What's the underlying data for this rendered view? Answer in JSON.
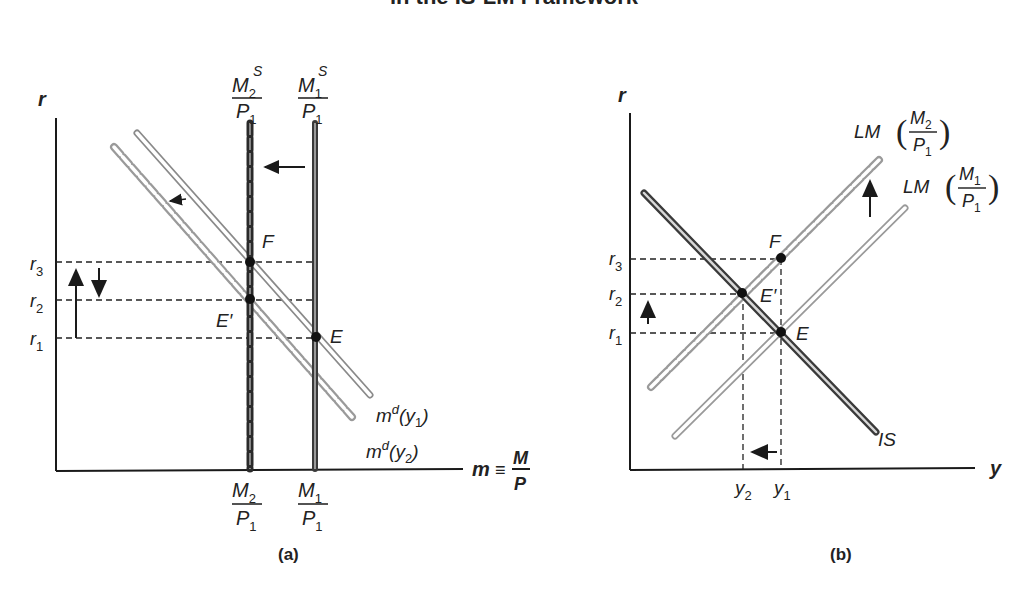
{
  "title": "in the IS-LM Framework",
  "panel_a": {
    "caption": "(a)",
    "y_axis": "r",
    "x_axis": "m ≡ M/P",
    "x_axis_m": "m",
    "x_axis_eq": "≡",
    "x_axis_num": "M",
    "x_axis_den": "P",
    "supply_labels": [
      {
        "num": "M",
        "num_sub": "2",
        "num_sup": "S",
        "den": "P",
        "den_sub": "1"
      },
      {
        "num": "M",
        "num_sub": "1",
        "num_sup": "S",
        "den": "P",
        "den_sub": "1"
      }
    ],
    "tick_labels": [
      {
        "num": "M",
        "num_sub": "2",
        "den": "P",
        "den_sub": "1"
      },
      {
        "num": "M",
        "num_sub": "1",
        "den": "P",
        "den_sub": "1"
      }
    ],
    "r_labels": [
      {
        "base": "r",
        "sub": "3"
      },
      {
        "base": "r",
        "sub": "2"
      },
      {
        "base": "r",
        "sub": "1"
      }
    ],
    "points": [
      "F",
      "E′",
      "E"
    ],
    "demand_labels": [
      {
        "base": "m",
        "sup": "d",
        "arg": "(y",
        "sub": "1",
        "close": ")"
      },
      {
        "base": "m",
        "sup": "d",
        "arg": "(y",
        "sub": "2",
        "close": ")"
      }
    ]
  },
  "panel_b": {
    "caption": "(b)",
    "y_axis": "r",
    "x_axis": "y",
    "r_labels": [
      {
        "base": "r",
        "sub": "3"
      },
      {
        "base": "r",
        "sub": "2"
      },
      {
        "base": "r",
        "sub": "1"
      }
    ],
    "y_labels": [
      {
        "base": "y",
        "sub": "2"
      },
      {
        "base": "y",
        "sub": "1"
      }
    ],
    "points": [
      "F",
      "E′",
      "E"
    ],
    "curve_labels": {
      "is": "IS",
      "lm2": {
        "prefix": "LM",
        "num": "M",
        "num_sub": "2",
        "den": "P",
        "den_sub": "1"
      },
      "lm1": {
        "prefix": "LM",
        "num": "M",
        "num_sub": "1",
        "den": "P",
        "den_sub": "1"
      }
    }
  },
  "colors": {
    "ink": "#1a1a1a",
    "dark_curve": "#3a3a3a",
    "light_curve": "#9a9a9a"
  }
}
